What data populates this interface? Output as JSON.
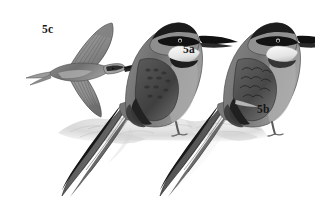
{
  "plate": {
    "title": "Bee-eater plate",
    "background_color": "#ffffff",
    "width": 315,
    "height": 216,
    "medium": "grayscale field-guide illustration"
  },
  "labels": [
    {
      "id": "5c",
      "text": "5c",
      "subject": "bee-eater in flight, upperside, wings spread"
    },
    {
      "id": "5a",
      "text": "5a",
      "subject": "perched bee-eater, left, long tail streamer"
    },
    {
      "id": "5b",
      "text": "5b",
      "subject": "perched bee-eater, right, long tail streamer"
    }
  ],
  "palette": {
    "ink": "#161616",
    "black": "#111111",
    "dark_gray": "#4a4a4a",
    "mid_gray": "#777777",
    "light_gray": "#b4b4b4",
    "pale_gray": "#d8d8d8",
    "throat_white": "#f2f2f2",
    "ground_gray": "#cfcfcf",
    "shadow_gray": "#bdbdbd",
    "background": "#ffffff"
  },
  "subjects": {
    "flying_bird": {
      "name": "5c",
      "pose": "gliding, viewed from above, both wings extended",
      "features": [
        "long pointed black bill",
        "dark eye mask",
        "pale grey underwing",
        "streaked flight feathers",
        "pointed tail"
      ]
    },
    "perched_left": {
      "name": "5a",
      "pose": "perched on rock, facing right",
      "features": [
        "black eye mask",
        "pale white throat",
        "dark gorget band",
        "long decurved black bill",
        "mottled dark wing panel",
        "long pointed tail streamer"
      ]
    },
    "perched_right": {
      "name": "5b",
      "pose": "perched on rock, facing right",
      "features": [
        "black eye mask",
        "pale white throat",
        "long decurved black bill",
        "scalloped wing coverts",
        "long pointed tail streamer"
      ]
    },
    "ground": {
      "name": "rock-perch",
      "description": "pale grey textured rocky mound with soft shadow"
    }
  }
}
